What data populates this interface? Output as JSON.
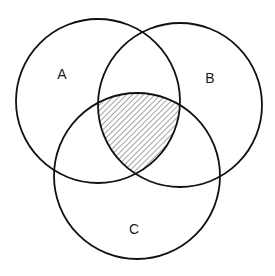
{
  "diagram": {
    "type": "venn",
    "sets": [
      {
        "id": "A",
        "label": "A",
        "cx": 98,
        "cy": 101,
        "r": 82,
        "label_x": 62,
        "label_y": 79
      },
      {
        "id": "B",
        "label": "B",
        "cx": 180,
        "cy": 105,
        "r": 82,
        "label_x": 210,
        "label_y": 83
      },
      {
        "id": "C",
        "label": "C",
        "cx": 137,
        "cy": 176,
        "r": 83,
        "label_x": 134,
        "label_y": 234
      }
    ],
    "shaded_region": "A ∩ B ∩ C",
    "shading_style": "diagonal-hatch",
    "colors": {
      "stroke": "#111111",
      "hatch": "#555555",
      "background": "#ffffff"
    }
  }
}
